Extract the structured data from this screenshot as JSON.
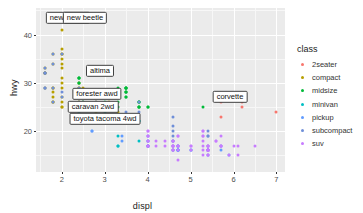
{
  "chart_data": {
    "type": "scatter",
    "title": "",
    "xlabel": "displ",
    "ylabel": "hwy",
    "xlim": [
      1.4,
      7.2
    ],
    "ylim": [
      11.5,
      45.5
    ],
    "xticks": [
      "2",
      "3",
      "4",
      "5",
      "6",
      "7"
    ],
    "xtick_values": [
      2,
      3,
      4,
      5,
      6,
      7
    ],
    "yticks": [
      "20",
      "30",
      "40"
    ],
    "ytick_values": [
      20,
      30,
      40
    ],
    "grid": true,
    "legend_position": "right",
    "legend_title": "class",
    "colors": {
      "2seater": "#F8766D",
      "compact": "#B79F00",
      "midsize": "#00BA38",
      "minivan": "#00BFC4",
      "pickup": "#619CFF",
      "subcompact": "#6F8FD8",
      "suv": "#C77CFF",
      "panel_background": "#EBEBEB",
      "grid_major": "#FFFFFF",
      "grid_minor": "#F7F7F7",
      "text": "#1A1A1A"
    },
    "series": [
      {
        "name": "2seater",
        "color": "#F8766D",
        "points": [
          [
            5.7,
            26
          ],
          [
            5.7,
            23
          ],
          [
            6.2,
            26
          ],
          [
            6.2,
            25
          ],
          [
            7.0,
            24
          ]
        ]
      },
      {
        "name": "compact",
        "color": "#B79F00",
        "points": [
          [
            1.8,
            29
          ],
          [
            1.8,
            29
          ],
          [
            2.0,
            31
          ],
          [
            2.0,
            30
          ],
          [
            1.8,
            26
          ],
          [
            1.8,
            26
          ],
          [
            2.0,
            27
          ],
          [
            2.0,
            26
          ],
          [
            2.8,
            26
          ],
          [
            2.8,
            25
          ],
          [
            3.1,
            26
          ],
          [
            1.8,
            28
          ],
          [
            1.8,
            27
          ],
          [
            2.0,
            25
          ],
          [
            2.0,
            25
          ],
          [
            2.8,
            25
          ],
          [
            2.8,
            24
          ],
          [
            3.1,
            25
          ],
          [
            3.1,
            23
          ],
          [
            2.4,
            27
          ],
          [
            2.4,
            30
          ],
          [
            2.4,
            26
          ],
          [
            2.4,
            29
          ],
          [
            2.5,
            27
          ],
          [
            2.5,
            26
          ],
          [
            3.3,
            24
          ],
          [
            2.0,
            33
          ],
          [
            2.0,
            35
          ],
          [
            2.0,
            37
          ],
          [
            2.0,
            36
          ],
          [
            2.0,
            34
          ],
          [
            1.9,
            44
          ],
          [
            2.0,
            41
          ],
          [
            2.0,
            29
          ],
          [
            2.5,
            28
          ],
          [
            2.5,
            29
          ],
          [
            1.6,
            33
          ],
          [
            1.6,
            32
          ],
          [
            1.6,
            32
          ],
          [
            1.6,
            29
          ],
          [
            1.6,
            32
          ],
          [
            1.8,
            34
          ],
          [
            1.8,
            36
          ],
          [
            2.0,
            36
          ],
          [
            2.4,
            29
          ],
          [
            2.4,
            26
          ],
          [
            2.5,
            28
          ],
          [
            2.5,
            27
          ]
        ]
      },
      {
        "name": "midsize",
        "color": "#00BA38",
        "points": [
          [
            3.1,
            27
          ],
          [
            3.1,
            25
          ],
          [
            3.8,
            25
          ],
          [
            3.8,
            25
          ],
          [
            3.8,
            25
          ],
          [
            4.0,
            25
          ],
          [
            3.5,
            29
          ],
          [
            3.5,
            29
          ],
          [
            3.0,
            27
          ],
          [
            3.0,
            27
          ],
          [
            3.5,
            28
          ],
          [
            3.5,
            27
          ],
          [
            3.5,
            29
          ],
          [
            3.5,
            28
          ],
          [
            2.4,
            31
          ],
          [
            2.4,
            30
          ],
          [
            3.0,
            28
          ],
          [
            3.0,
            27
          ],
          [
            3.3,
            26
          ],
          [
            3.3,
            25
          ],
          [
            3.8,
            26
          ],
          [
            3.8,
            26
          ],
          [
            2.5,
            27
          ],
          [
            2.5,
            26
          ],
          [
            3.0,
            26
          ],
          [
            3.0,
            25
          ],
          [
            3.5,
            28
          ],
          [
            3.5,
            27
          ],
          [
            5.3,
            25
          ],
          [
            2.4,
            31
          ],
          [
            2.4,
            30
          ],
          [
            2.4,
            31
          ],
          [
            3.0,
            27
          ],
          [
            3.5,
            29
          ],
          [
            3.3,
            29
          ],
          [
            4.0,
            25
          ],
          [
            3.8,
            26
          ]
        ]
      },
      {
        "name": "minivan",
        "color": "#00BFC4",
        "points": [
          [
            2.4,
            24
          ],
          [
            3.0,
            24
          ],
          [
            3.3,
            22
          ],
          [
            3.3,
            22
          ],
          [
            3.8,
            22
          ],
          [
            3.8,
            22
          ],
          [
            4.0,
            17
          ],
          [
            3.3,
            17
          ],
          [
            3.8,
            18
          ],
          [
            3.3,
            19
          ],
          [
            3.3,
            17
          ]
        ]
      },
      {
        "name": "pickup",
        "color": "#619CFF",
        "points": [
          [
            2.7,
            20
          ],
          [
            2.7,
            20
          ],
          [
            3.4,
            19
          ],
          [
            3.4,
            18
          ],
          [
            4.0,
            18
          ],
          [
            4.0,
            17
          ],
          [
            4.7,
            17
          ],
          [
            4.7,
            17
          ],
          [
            4.7,
            17
          ],
          [
            4.7,
            16
          ],
          [
            5.7,
            16
          ],
          [
            5.7,
            17
          ],
          [
            4.6,
            16
          ],
          [
            5.4,
            16
          ],
          [
            5.4,
            16
          ],
          [
            4.0,
            17
          ],
          [
            4.0,
            19
          ],
          [
            4.6,
            18
          ],
          [
            5.0,
            16
          ],
          [
            5.4,
            16
          ],
          [
            4.7,
            16
          ],
          [
            4.7,
            16
          ],
          [
            5.4,
            16
          ],
          [
            5.4,
            15
          ],
          [
            4.0,
            17
          ],
          [
            4.7,
            16
          ],
          [
            5.0,
            16
          ],
          [
            5.9,
            15
          ],
          [
            4.6,
            17
          ],
          [
            5.4,
            16
          ],
          [
            5.4,
            16
          ],
          [
            4.7,
            16
          ],
          [
            4.0,
            18
          ]
        ]
      },
      {
        "name": "subcompact",
        "color": "#6F8FD8",
        "points": [
          [
            1.6,
            29
          ],
          [
            1.8,
            29
          ],
          [
            1.8,
            26
          ],
          [
            2.0,
            28
          ],
          [
            2.0,
            27
          ],
          [
            2.8,
            26
          ],
          [
            2.8,
            25
          ],
          [
            3.1,
            25
          ],
          [
            1.6,
            33
          ],
          [
            1.6,
            32
          ],
          [
            1.6,
            32
          ],
          [
            1.6,
            29
          ],
          [
            1.6,
            32
          ],
          [
            1.8,
            34
          ],
          [
            1.8,
            36
          ],
          [
            2.0,
            36
          ],
          [
            2.4,
            29
          ],
          [
            2.4,
            26
          ],
          [
            2.5,
            28
          ],
          [
            2.5,
            27
          ],
          [
            3.8,
            26
          ],
          [
            4.6,
            23
          ],
          [
            5.4,
            19
          ],
          [
            5.4,
            20
          ],
          [
            3.8,
            24
          ],
          [
            4.6,
            20
          ],
          [
            4.6,
            21
          ],
          [
            4.6,
            19
          ],
          [
            5.4,
            19
          ],
          [
            2.5,
            26
          ],
          [
            2.5,
            27
          ],
          [
            3.5,
            24
          ],
          [
            4.6,
            18
          ],
          [
            4.6,
            16
          ],
          [
            5.4,
            17
          ]
        ]
      },
      {
        "name": "suv",
        "color": "#C77CFF",
        "points": [
          [
            4.0,
            17
          ],
          [
            4.0,
            17
          ],
          [
            4.0,
            17
          ],
          [
            4.6,
            17
          ],
          [
            4.6,
            16
          ],
          [
            5.4,
            16
          ],
          [
            5.4,
            15
          ],
          [
            4.0,
            18
          ],
          [
            4.0,
            17
          ],
          [
            4.6,
            17
          ],
          [
            5.0,
            17
          ],
          [
            5.4,
            16
          ],
          [
            5.4,
            15
          ],
          [
            4.7,
            17
          ],
          [
            4.7,
            17
          ],
          [
            4.7,
            17
          ],
          [
            5.7,
            17
          ],
          [
            5.7,
            17
          ],
          [
            6.1,
            17
          ],
          [
            4.0,
            18
          ],
          [
            4.2,
            17
          ],
          [
            4.4,
            17
          ],
          [
            4.6,
            16
          ],
          [
            5.4,
            16
          ],
          [
            5.4,
            16
          ],
          [
            5.4,
            17
          ],
          [
            4.0,
            19
          ],
          [
            4.0,
            19
          ],
          [
            4.6,
            17
          ],
          [
            5.0,
            17
          ],
          [
            4.6,
            18
          ],
          [
            4.6,
            18
          ],
          [
            5.4,
            17
          ],
          [
            5.4,
            17
          ],
          [
            5.4,
            16
          ],
          [
            5.9,
            15
          ],
          [
            6.5,
            17
          ],
          [
            4.7,
            19
          ],
          [
            4.7,
            19
          ],
          [
            5.7,
            19
          ],
          [
            5.3,
            20
          ],
          [
            5.3,
            19
          ],
          [
            5.3,
            20
          ],
          [
            5.3,
            17
          ],
          [
            5.3,
            16
          ],
          [
            5.3,
            15
          ],
          [
            4.7,
            14
          ],
          [
            5.7,
            17
          ],
          [
            6.0,
            17
          ],
          [
            6.1,
            15
          ],
          [
            4.6,
            17
          ],
          [
            4.2,
            18
          ],
          [
            4.4,
            18
          ],
          [
            5.4,
            16
          ],
          [
            4.7,
            16
          ],
          [
            5.0,
            16
          ],
          [
            4.0,
            20
          ],
          [
            4.0,
            20
          ],
          [
            5.6,
            18
          ],
          [
            5.6,
            18
          ],
          [
            5.3,
            19
          ],
          [
            5.3,
            18
          ]
        ]
      }
    ],
    "annotations": [
      {
        "label": "new beetle",
        "x": 1.9,
        "y": 44,
        "px": 68,
        "py": 18
      },
      {
        "label": "new beetle",
        "x": 2.0,
        "y": 44,
        "px": 85,
        "py": 18
      },
      {
        "label": "altima",
        "x": 2.4,
        "y": 34,
        "px": 100,
        "py": 71
      },
      {
        "label": "forester awd",
        "x": 2.5,
        "y": 29,
        "px": 97,
        "py": 94
      },
      {
        "label": "caravan 2wd",
        "x": 2.4,
        "y": 26,
        "px": 93,
        "py": 107
      },
      {
        "label": "toyota tacoma 4wd",
        "x": 2.7,
        "y": 24,
        "px": 105,
        "py": 119
      },
      {
        "label": "corvette",
        "x": 5.7,
        "y": 26,
        "px": 230,
        "py": 97
      }
    ]
  }
}
